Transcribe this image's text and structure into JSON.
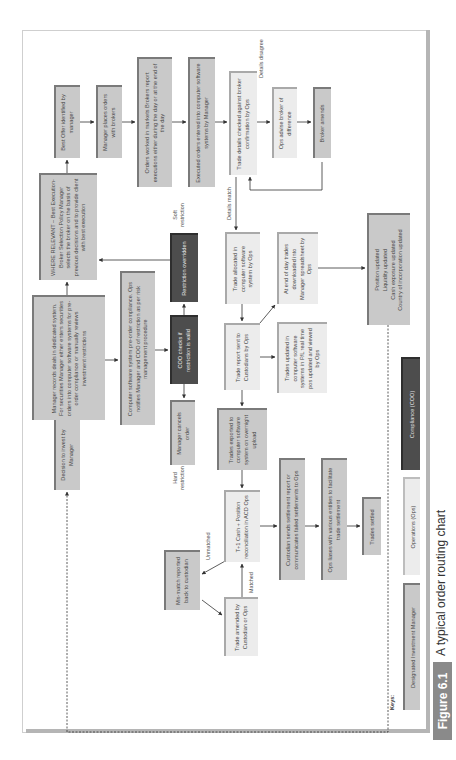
{
  "figure": {
    "number": "Figure 6.1",
    "caption": "A typical order routing chart"
  },
  "boxes": {
    "decision": "Decision to invest by Manager",
    "manager_records": "Manager records deals in dedicated system. For securities Manager either enters securities orders into computer software systems for pre-order compliance or manually reviews investment restrictions",
    "where_relevant": "WHERE RELEVANT – Best Execution-Broker Selection Policy Manager selects the broker on the basis of previous decisions and to provide client with best execution",
    "best_offer": "Best Offer identified by manager",
    "manager_places": "Manager places orders with brokers",
    "orders_worked": "Orders worked in markets Brokers report executions either during the day or at the end of the day",
    "executed_orders": "Executed orders entered into computer software systems by Manager",
    "trade_details_checked": "Trade details checked against broker confirmation by Ops",
    "ops_advise": "Ops advise broker of difference",
    "broker_amends": "Broker amends",
    "computer_software_preorder": "Computer software system pre-order compliance. Ops notifies Manager and COO of restriction as per risk management procedure",
    "coo_checks": "COO checks if restriction is valid",
    "restriction_overridden": "Restriction overridden",
    "manager_cancels": "Manager cancels order",
    "trade_allocated": "Trade allocated in computer software system by Ops",
    "end_of_day": "At end of day trades downloaded into Manager spreadsheet by Ops",
    "trade_report_sent": "Trade report sent to Custodians by Ops",
    "trades_updated": "Trades updated in computer software systems in P/L real time pos updated and viewed by Ops",
    "position_updated": "Position updated\nLiquidity updated\nCash exposure updated\nCountry of incorporation updated",
    "trades_exported": "Trades exported to computer software system on overnight upload",
    "t1_recon": "T+1 Cash + Position reconciliation in ACD Ops",
    "custodian_sends": "Custodian sends settlement report or communicates failed settlements to Ops",
    "ops_liases": "Ops liases with various entities to facilitate trade settlement",
    "trades_settled": "Trades settled",
    "mismatch": "Mis-match reported back to custodian",
    "trade_amended": "Trade amended by Custodian or Ops"
  },
  "labels": {
    "soft_restriction": "Soft restriction",
    "hard_restriction": "Hard restriction",
    "details_match": "Details match",
    "details_disagree": "Details disagree",
    "unmatched": "Unmatched",
    "matched": "Matched"
  },
  "keys": {
    "title": "Keys:",
    "items": [
      {
        "label": "Designated Investment Manager",
        "color": "#c9c9c9"
      },
      {
        "label": "Operations (Ops)",
        "color": "#ececec"
      },
      {
        "label": "Compliance (COO)",
        "color": "#4d4d4d"
      }
    ]
  }
}
